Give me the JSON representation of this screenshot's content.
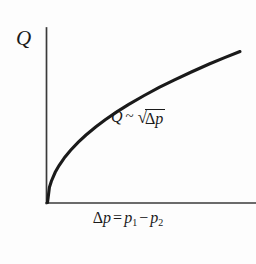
{
  "chart_data": {
    "type": "line",
    "title": "",
    "subtitle": "",
    "xlabel_parts": {
      "delta": "Δ",
      "p": "p",
      "equals": "=",
      "p1_base": "p",
      "p1_sub": "1",
      "minus": "−",
      "p2_base": "p",
      "p2_sub": "2"
    },
    "xlabel": "Δp = p₁ − p₂",
    "ylabel": "Q",
    "annotation": "Q ~ √Δp",
    "annotation_parts": {
      "lhs": "Q",
      "relation": "~",
      "radical_sign": "√",
      "radicand_delta": "Δ",
      "radicand_var": "p"
    },
    "relationship": "Q is proportional to the square root of the pressure difference",
    "grid": false,
    "legend": "none",
    "axis_arrows": false,
    "xlim": [
      0,
      1
    ],
    "ylim": [
      0,
      1
    ],
    "x": [
      0.0,
      0.01,
      0.02,
      0.04,
      0.06,
      0.09,
      0.12,
      0.16,
      0.2,
      0.25,
      0.3,
      0.36,
      0.42,
      0.5,
      0.58,
      0.66,
      0.75,
      0.84,
      0.92,
      1.0
    ],
    "values": [
      0.0,
      0.1,
      0.141,
      0.2,
      0.245,
      0.3,
      0.346,
      0.4,
      0.447,
      0.5,
      0.548,
      0.6,
      0.648,
      0.707,
      0.762,
      0.812,
      0.866,
      0.917,
      0.959,
      1.0
    ],
    "curve_color": "#1a1a1a",
    "axis_color": "#3a3a3a",
    "background_color": "#fdfdfd",
    "tick_labels_x": [],
    "tick_labels_y": []
  }
}
